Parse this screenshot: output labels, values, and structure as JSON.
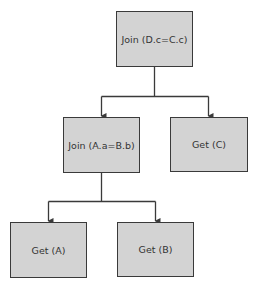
{
  "diagram": {
    "type": "query-plan-tree",
    "nodes": [
      {
        "id": "join_dc",
        "label": "Join (D.c=C.c)",
        "x": 116,
        "y": 11,
        "w": 77,
        "h": 56
      },
      {
        "id": "join_ab",
        "label": "Join (A.a=B.b)",
        "x": 63,
        "y": 117,
        "w": 77,
        "h": 56
      },
      {
        "id": "get_c",
        "label": "Get (C)",
        "x": 170,
        "y": 117,
        "w": 78,
        "h": 55
      },
      {
        "id": "get_a",
        "label": "Get (A)",
        "x": 10,
        "y": 222,
        "w": 77,
        "h": 56
      },
      {
        "id": "get_b",
        "label": "Get (B)",
        "x": 117,
        "y": 222,
        "w": 77,
        "h": 55
      }
    ],
    "edges": [
      {
        "from": "join_dc",
        "to": "join_ab"
      },
      {
        "from": "join_dc",
        "to": "get_c"
      },
      {
        "from": "join_ab",
        "to": "get_a"
      },
      {
        "from": "join_ab",
        "to": "get_b"
      }
    ],
    "colors": {
      "fill": "#d3d3d3",
      "border": "#3a3a3a",
      "line": "#3a3a3a",
      "text": "#333333"
    }
  }
}
